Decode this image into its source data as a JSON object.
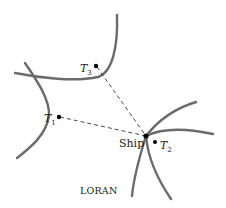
{
  "diagram": {
    "caption": "LORAN",
    "stations": [
      {
        "id": "T1",
        "letter": "T",
        "sub": "1"
      },
      {
        "id": "T2",
        "letter": "T",
        "sub": "2"
      },
      {
        "id": "T3",
        "letter": "T",
        "sub": "3"
      }
    ],
    "ship_label": "Ship",
    "colors": {
      "curve": "#6b6b6b",
      "dash": "#333333",
      "dot": "#000000"
    }
  }
}
